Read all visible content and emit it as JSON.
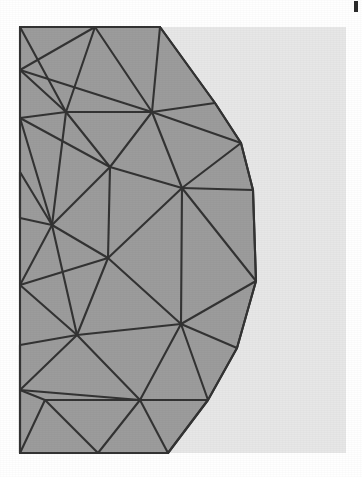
{
  "figure": {
    "kind": "mesh-diagram",
    "canvas": {
      "width": 362,
      "height": 477
    },
    "colors": {
      "page_background": "#ffffff",
      "panel_background": "#e7e7e7",
      "mesh_fill": "#9c9c9c",
      "mesh_edge": "#333333",
      "tick_mark": "#2b2b2b"
    },
    "panel": {
      "x": 20,
      "y": 27,
      "width": 326,
      "height": 426
    },
    "edge_width": 2.1,
    "corner_tick": {
      "x": 354,
      "y": 1,
      "width": 4,
      "height": 11
    }
  },
  "chart_data": {
    "type": "mesh",
    "xlabel": "",
    "ylabel": "",
    "xlim": [
      0,
      362
    ],
    "ylim": [
      0,
      477
    ],
    "grid": false,
    "legend": null,
    "vertex_count": 32,
    "triangle_count": 44,
    "vertices": [
      [
        20,
        27
      ],
      [
        20,
        70
      ],
      [
        20,
        118
      ],
      [
        20,
        172
      ],
      [
        20,
        218
      ],
      [
        20,
        285
      ],
      [
        20,
        345
      ],
      [
        20,
        390
      ],
      [
        20,
        453
      ],
      [
        95,
        27
      ],
      [
        20,
        27
      ],
      [
        100,
        70
      ],
      [
        66,
        112
      ],
      [
        160,
        27
      ],
      [
        152,
        112
      ],
      [
        110,
        167
      ],
      [
        182,
        188
      ],
      [
        108,
        258
      ],
      [
        52,
        225
      ],
      [
        77,
        335
      ],
      [
        45,
        400
      ],
      [
        140,
        400
      ],
      [
        181,
        324
      ],
      [
        215,
        103
      ],
      [
        241,
        143
      ],
      [
        253,
        190
      ],
      [
        256,
        281
      ],
      [
        237,
        348
      ],
      [
        208,
        400
      ],
      [
        168,
        453
      ],
      [
        210,
        400
      ],
      [
        20,
        453
      ]
    ],
    "boundary_arc": {
      "description": "right boundary is a polygonal approximation of a circular arc",
      "points": [
        [
          160,
          27
        ],
        [
          215,
          103
        ],
        [
          241,
          143
        ],
        [
          253,
          190
        ],
        [
          256,
          281
        ],
        [
          237,
          348
        ],
        [
          208,
          400
        ],
        [
          168,
          453
        ]
      ]
    },
    "edges": [
      [
        [
          20,
          27
        ],
        [
          160,
          27
        ]
      ],
      [
        [
          20,
          27
        ],
        [
          66,
          112
        ]
      ],
      [
        [
          95,
          27
        ],
        [
          66,
          112
        ]
      ],
      [
        [
          95,
          27
        ],
        [
          20,
          70
        ]
      ],
      [
        [
          20,
          70
        ],
        [
          66,
          112
        ]
      ],
      [
        [
          20,
          70
        ],
        [
          152,
          112
        ]
      ],
      [
        [
          95,
          27
        ],
        [
          152,
          112
        ]
      ],
      [
        [
          160,
          27
        ],
        [
          152,
          112
        ]
      ],
      [
        [
          160,
          27
        ],
        [
          215,
          103
        ]
      ],
      [
        [
          152,
          112
        ],
        [
          215,
          103
        ]
      ],
      [
        [
          152,
          112
        ],
        [
          241,
          143
        ]
      ],
      [
        [
          215,
          103
        ],
        [
          241,
          143
        ]
      ],
      [
        [
          66,
          112
        ],
        [
          152,
          112
        ]
      ],
      [
        [
          66,
          112
        ],
        [
          110,
          167
        ]
      ],
      [
        [
          110,
          167
        ],
        [
          152,
          112
        ]
      ],
      [
        [
          110,
          167
        ],
        [
          182,
          188
        ]
      ],
      [
        [
          152,
          112
        ],
        [
          182,
          188
        ]
      ],
      [
        [
          182,
          188
        ],
        [
          241,
          143
        ]
      ],
      [
        [
          182,
          188
        ],
        [
          253,
          190
        ]
      ],
      [
        [
          241,
          143
        ],
        [
          253,
          190
        ]
      ],
      [
        [
          20,
          118
        ],
        [
          66,
          112
        ]
      ],
      [
        [
          20,
          118
        ],
        [
          110,
          167
        ]
      ],
      [
        [
          20,
          118
        ],
        [
          52,
          225
        ]
      ],
      [
        [
          66,
          112
        ],
        [
          52,
          225
        ]
      ],
      [
        [
          52,
          225
        ],
        [
          110,
          167
        ]
      ],
      [
        [
          20,
          172
        ],
        [
          52,
          225
        ]
      ],
      [
        [
          20,
          172
        ],
        [
          20,
          218
        ]
      ],
      [
        [
          20,
          218
        ],
        [
          52,
          225
        ]
      ],
      [
        [
          52,
          225
        ],
        [
          108,
          258
        ]
      ],
      [
        [
          110,
          167
        ],
        [
          108,
          258
        ]
      ],
      [
        [
          108,
          258
        ],
        [
          182,
          188
        ]
      ],
      [
        [
          182,
          188
        ],
        [
          256,
          281
        ]
      ],
      [
        [
          253,
          190
        ],
        [
          256,
          281
        ]
      ],
      [
        [
          108,
          258
        ],
        [
          181,
          324
        ]
      ],
      [
        [
          182,
          188
        ],
        [
          181,
          324
        ]
      ],
      [
        [
          181,
          324
        ],
        [
          256,
          281
        ]
      ],
      [
        [
          20,
          285
        ],
        [
          52,
          225
        ]
      ],
      [
        [
          20,
          285
        ],
        [
          108,
          258
        ]
      ],
      [
        [
          20,
          285
        ],
        [
          77,
          335
        ]
      ],
      [
        [
          52,
          225
        ],
        [
          77,
          335
        ]
      ],
      [
        [
          77,
          335
        ],
        [
          108,
          258
        ]
      ],
      [
        [
          77,
          335
        ],
        [
          181,
          324
        ]
      ],
      [
        [
          20,
          345
        ],
        [
          77,
          335
        ]
      ],
      [
        [
          20,
          345
        ],
        [
          20,
          390
        ]
      ],
      [
        [
          20,
          390
        ],
        [
          77,
          335
        ]
      ],
      [
        [
          77,
          335
        ],
        [
          140,
          400
        ]
      ],
      [
        [
          140,
          400
        ],
        [
          181,
          324
        ]
      ],
      [
        [
          181,
          324
        ],
        [
          237,
          348
        ]
      ],
      [
        [
          256,
          281
        ],
        [
          237,
          348
        ]
      ],
      [
        [
          181,
          324
        ],
        [
          208,
          400
        ]
      ],
      [
        [
          237,
          348
        ],
        [
          208,
          400
        ]
      ],
      [
        [
          140,
          400
        ],
        [
          208,
          400
        ]
      ],
      [
        [
          20,
          390
        ],
        [
          45,
          400
        ]
      ],
      [
        [
          20,
          390
        ],
        [
          140,
          400
        ]
      ],
      [
        [
          45,
          400
        ],
        [
          140,
          400
        ]
      ],
      [
        [
          20,
          453
        ],
        [
          45,
          400
        ]
      ],
      [
        [
          20,
          453
        ],
        [
          20,
          390
        ]
      ],
      [
        [
          45,
          400
        ],
        [
          98,
          453
        ]
      ],
      [
        [
          20,
          453
        ],
        [
          98,
          453
        ]
      ],
      [
        [
          98,
          453
        ],
        [
          140,
          400
        ]
      ],
      [
        [
          140,
          400
        ],
        [
          168,
          453
        ]
      ],
      [
        [
          98,
          453
        ],
        [
          168,
          453
        ]
      ],
      [
        [
          168,
          453
        ],
        [
          208,
          400
        ]
      ]
    ],
    "notes": [
      "Mesh fills the left portion of a light-gray panel.",
      "Domain is bounded left by a vertical straight edge and right by a convex arc.",
      "Mesh is clipped at the panel bottom edge."
    ]
  }
}
